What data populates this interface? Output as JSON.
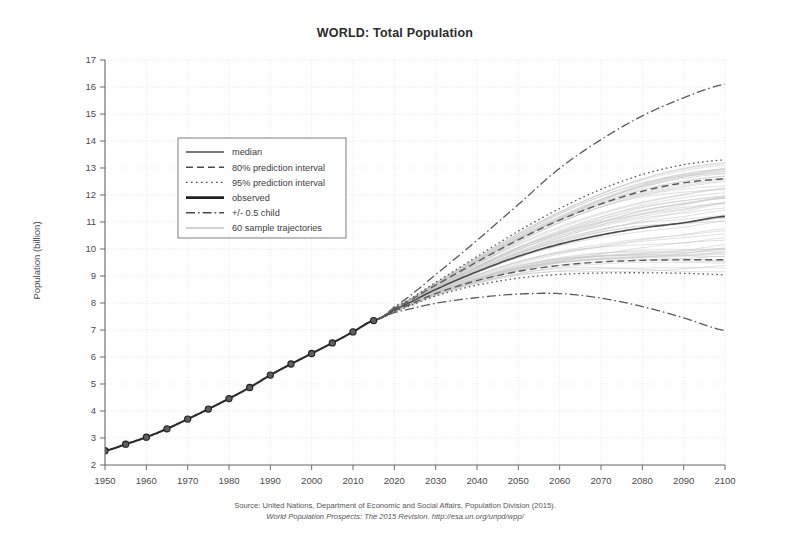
{
  "chart_data": {
    "type": "line",
    "title": "WORLD: Total Population",
    "xlabel": "",
    "ylabel": "Population (billion)",
    "xlim": [
      1950,
      2100
    ],
    "ylim": [
      2,
      17
    ],
    "grid": true,
    "legend_position": "upper-left-inside",
    "x_ticks": [
      1950,
      1960,
      1970,
      1980,
      1990,
      2000,
      2010,
      2020,
      2030,
      2040,
      2050,
      2060,
      2070,
      2080,
      2090,
      2100
    ],
    "y_ticks": [
      2,
      3,
      4,
      5,
      6,
      7,
      8,
      9,
      10,
      11,
      12,
      13,
      14,
      15,
      16,
      17
    ],
    "legend": [
      {
        "label": "median",
        "style": "solid-thin"
      },
      {
        "label": "80% prediction interval",
        "style": "dashed"
      },
      {
        "label": "95% prediction interval",
        "style": "dotted"
      },
      {
        "label": "observed",
        "style": "solid-thick"
      },
      {
        "label": "+/- 0.5 child",
        "style": "dash-dot"
      },
      {
        "label": "60 sample trajectories",
        "style": "solid-light"
      }
    ],
    "series": [
      {
        "name": "observed",
        "style": "solid-thick-markers",
        "x": [
          1950,
          1955,
          1960,
          1965,
          1970,
          1975,
          1980,
          1985,
          1990,
          1995,
          2000,
          2005,
          2010,
          2015
        ],
        "values": [
          2.53,
          2.77,
          3.03,
          3.34,
          3.7,
          4.07,
          4.46,
          4.87,
          5.33,
          5.74,
          6.13,
          6.52,
          6.93,
          7.35
        ]
      },
      {
        "name": "median",
        "style": "solid-thin",
        "x": [
          2015,
          2020,
          2030,
          2040,
          2050,
          2060,
          2070,
          2080,
          2090,
          2100
        ],
        "values": [
          7.35,
          7.76,
          8.5,
          9.16,
          9.73,
          10.18,
          10.52,
          10.78,
          10.97,
          11.21
        ]
      },
      {
        "name": "80% prediction interval upper",
        "style": "dashed",
        "x": [
          2015,
          2020,
          2030,
          2040,
          2050,
          2060,
          2070,
          2080,
          2090,
          2100
        ],
        "values": [
          7.35,
          7.8,
          8.66,
          9.52,
          10.34,
          11.07,
          11.67,
          12.14,
          12.45,
          12.6
        ]
      },
      {
        "name": "80% prediction interval lower",
        "style": "dashed",
        "x": [
          2015,
          2020,
          2030,
          2040,
          2050,
          2060,
          2070,
          2080,
          2090,
          2100
        ],
        "values": [
          7.35,
          7.72,
          8.35,
          8.83,
          9.17,
          9.39,
          9.52,
          9.58,
          9.6,
          9.6
        ]
      },
      {
        "name": "95% prediction interval upper",
        "style": "dotted",
        "x": [
          2015,
          2020,
          2030,
          2040,
          2050,
          2060,
          2070,
          2080,
          2090,
          2100
        ],
        "values": [
          7.35,
          7.83,
          8.76,
          9.72,
          10.66,
          11.5,
          12.21,
          12.76,
          13.12,
          13.3
        ]
      },
      {
        "name": "95% prediction interval lower",
        "style": "dotted",
        "x": [
          2015,
          2020,
          2030,
          2040,
          2050,
          2060,
          2070,
          2080,
          2090,
          2100
        ],
        "values": [
          7.35,
          7.69,
          8.26,
          8.66,
          8.92,
          9.06,
          9.11,
          9.12,
          9.1,
          9.05
        ]
      },
      {
        "name": "+/- 0.5 child high",
        "style": "dash-dot",
        "x": [
          2015,
          2020,
          2030,
          2040,
          2050,
          2060,
          2070,
          2080,
          2090,
          2100
        ],
        "values": [
          7.35,
          7.87,
          9.05,
          10.32,
          11.65,
          12.99,
          14.05,
          14.93,
          15.6,
          16.1
        ]
      },
      {
        "name": "+/- 0.5 child low",
        "style": "dash-dot",
        "x": [
          2015,
          2020,
          2030,
          2040,
          2050,
          2060,
          2070,
          2080,
          2090,
          2100
        ],
        "values": [
          7.35,
          7.65,
          7.99,
          8.2,
          8.33,
          8.35,
          8.18,
          7.87,
          7.45,
          6.98
        ]
      }
    ],
    "sample_trajectories_count": 60
  },
  "source": {
    "line1": "Source: United Nations, Department of Economic and Social Affairs, Population Division (2015).",
    "line2": "World Population Prospects: The 2015 Revision. http://esa.un.org/unpd/wpp/"
  },
  "colors": {
    "median": "#4a4a4a",
    "observed": "#2a2a2a",
    "interval": "#5a5a5a",
    "trajectory": "#c6c6c6",
    "grid": "#d8d8d8",
    "axis": "#6b6b6b",
    "background": "#ffffff"
  }
}
